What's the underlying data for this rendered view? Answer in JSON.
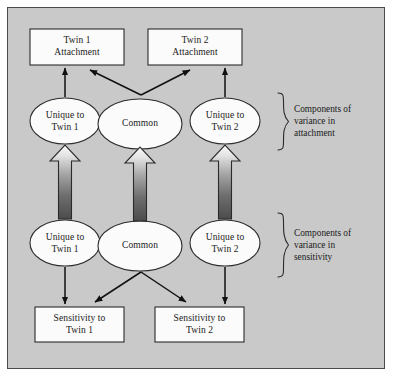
{
  "figure": {
    "type": "path-diagram",
    "background_color": "#c9c9c9",
    "border_color": "#4a4a4a",
    "page_color": "#ffffff",
    "text_color": "#1a1a1a"
  },
  "nodes": {
    "attachment_boxes": [
      {
        "id": "twin1-attachment",
        "label": "Twin 1\nAttachment",
        "shape": "rectangle",
        "fill": "#fbfbfb"
      },
      {
        "id": "twin2-attachment",
        "label": "Twin 2\nAttachment",
        "shape": "rectangle",
        "fill": "#fbfbfb"
      }
    ],
    "attachment_components": [
      {
        "id": "attachment-unique-twin1",
        "label": "Unique to\nTwin 1",
        "shape": "ellipse",
        "fill": "#fbfbfb"
      },
      {
        "id": "attachment-common",
        "label": "Common",
        "shape": "ellipse",
        "fill": "#fbfbfb"
      },
      {
        "id": "attachment-unique-twin2",
        "label": "Unique to\nTwin 2",
        "shape": "ellipse",
        "fill": "#fbfbfb"
      }
    ],
    "sensitivity_components": [
      {
        "id": "sensitivity-unique-twin1",
        "label": "Unique to\nTwin 1",
        "shape": "ellipse",
        "fill": "#fbfbfb"
      },
      {
        "id": "sensitivity-common",
        "label": "Common",
        "shape": "ellipse",
        "fill": "#fbfbfb"
      },
      {
        "id": "sensitivity-unique-twin2",
        "label": "Unique to\nTwin 2",
        "shape": "ellipse",
        "fill": "#fbfbfb"
      }
    ],
    "sensitivity_boxes": [
      {
        "id": "sensitivity-twin1",
        "label": "Sensitivity to\nTwin 1",
        "shape": "rectangle",
        "fill": "#fbfbfb"
      },
      {
        "id": "sensitivity-twin2",
        "label": "Sensitivity to\nTwin 2",
        "shape": "rectangle",
        "fill": "#fbfbfb"
      }
    ]
  },
  "brackets": [
    {
      "id": "attachment-bracket",
      "label": "Components of\nvariance in\nattachment"
    },
    {
      "id": "sensitivity-bracket",
      "label": "Components of\nvariance in\nsensitivity"
    }
  ],
  "connectors": {
    "thin_arrows": [
      {
        "from": "attachment-unique-twin1",
        "to": "twin1-attachment",
        "style": "line-arrow"
      },
      {
        "from": "attachment-unique-twin2",
        "to": "twin2-attachment",
        "style": "line-arrow"
      },
      {
        "from": "attachment-common",
        "to": "twin1-attachment",
        "style": "line-arrow"
      },
      {
        "from": "attachment-common",
        "to": "twin2-attachment",
        "style": "line-arrow"
      },
      {
        "from": "sensitivity-unique-twin1",
        "to": "sensitivity-twin1",
        "style": "line-arrow"
      },
      {
        "from": "sensitivity-unique-twin2",
        "to": "sensitivity-twin2",
        "style": "line-arrow"
      },
      {
        "from": "sensitivity-common",
        "to": "sensitivity-twin1",
        "style": "line-arrow"
      },
      {
        "from": "sensitivity-common",
        "to": "sensitivity-twin2",
        "style": "line-arrow"
      }
    ],
    "block_arrows": [
      {
        "from": "sensitivity-unique-twin1",
        "to": "attachment-unique-twin1",
        "style": "gradient-block-arrow"
      },
      {
        "from": "sensitivity-common",
        "to": "attachment-common",
        "style": "gradient-block-arrow"
      },
      {
        "from": "sensitivity-unique-twin2",
        "to": "attachment-unique-twin2",
        "style": "gradient-block-arrow"
      }
    ]
  }
}
